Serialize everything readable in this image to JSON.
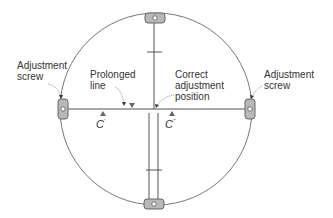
{
  "diagram": {
    "labels": {
      "left_screw": "Adjustment\nscrew",
      "right_screw": "Adjustment\nscrew",
      "prolonged_line": "Prolonged\nline",
      "correct_position": "Correct\nadjustment\nposition",
      "c_prime": "C",
      "c_prime_mark": "'",
      "c_double_prime": "C",
      "c_double_prime_mark": "''"
    },
    "colors": {
      "line": "#555555",
      "screw_fill": "#b8b8b8",
      "screw_stroke": "#666666",
      "marker": "#666666"
    }
  }
}
